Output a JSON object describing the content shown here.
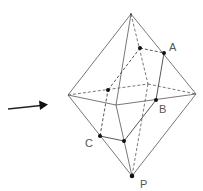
{
  "diagram": {
    "labels": {
      "A": "A",
      "B": "B",
      "C": "C",
      "P": "P"
    },
    "arrow": "view-direction-arrow"
  }
}
